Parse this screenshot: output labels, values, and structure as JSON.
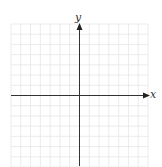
{
  "diagram": {
    "type": "cartesian-coordinate-grid",
    "x_axis_label": "x",
    "y_axis_label": "y",
    "grid": {
      "columns": 14,
      "rows": 15,
      "columns_left_of_y_axis": 7,
      "columns_right_of_y_axis": 7,
      "rows_above_x_axis": 7,
      "rows_below_x_axis": 7,
      "tick_labels_shown": false
    },
    "colors": {
      "grid_line": "#e6e6e6",
      "axis": "#333333",
      "background": "#ffffff"
    }
  }
}
